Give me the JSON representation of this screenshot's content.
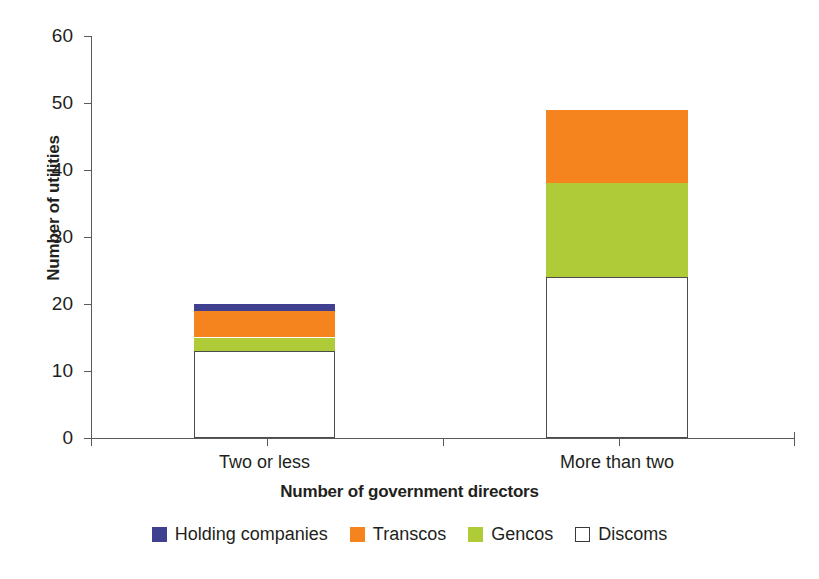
{
  "chart_data": {
    "type": "bar",
    "subtype": "stacked-bar",
    "title": "",
    "xlabel": "Number of government directors",
    "ylabel": "Number of utilities",
    "categories": [
      "Two or less",
      "More than two"
    ],
    "ylim": [
      0,
      60
    ],
    "yticks": [
      0,
      10,
      20,
      30,
      40,
      50,
      60
    ],
    "ytick_labels": [
      "0",
      "10",
      "20",
      "30",
      "40",
      "50",
      "60"
    ],
    "grid": false,
    "legend_position": "bottom",
    "stack_order_bottom_to_top": [
      "Discoms",
      "Gencos",
      "Transcos",
      "Holding companies"
    ],
    "series": [
      {
        "name": "Discoms",
        "color": "#ffffff",
        "border_color": "#4b4b4d",
        "values": [
          13,
          24
        ]
      },
      {
        "name": "Gencos",
        "color": "#afcb38",
        "values": [
          2,
          14
        ]
      },
      {
        "name": "Transcos",
        "color": "#f5841f",
        "values": [
          4,
          11
        ]
      },
      {
        "name": "Holding companies",
        "color": "#3f4090",
        "values": [
          1,
          0
        ]
      }
    ],
    "cumulative_totals": [
      20,
      49
    ],
    "annotations": []
  },
  "legend": {
    "items": [
      {
        "label": "Holding companies",
        "color": "#3f4090",
        "style": "filled"
      },
      {
        "label": "Transcos",
        "color": "#f5841f",
        "style": "filled"
      },
      {
        "label": "Gencos",
        "color": "#afcb38",
        "style": "filled"
      },
      {
        "label": "Discoms",
        "color": "#ffffff",
        "style": "outlined"
      }
    ]
  },
  "axis": {
    "y_title": "Number of utilities",
    "x_title": "Number of government directors"
  },
  "colors": {
    "holding_companies": "#3f4090",
    "transcos": "#f5841f",
    "gencos": "#afcb38",
    "discoms": "#ffffff",
    "axis": "#58595b",
    "text": "#231f20"
  }
}
